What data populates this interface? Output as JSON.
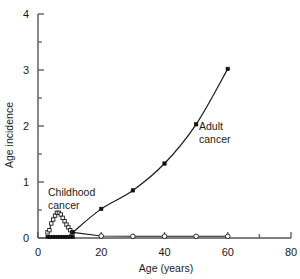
{
  "chart_data": {
    "type": "line",
    "title": "",
    "xlabel": "Age (years)",
    "ylabel": "Age incidence",
    "xlim": [
      0,
      80
    ],
    "ylim": [
      0,
      4
    ],
    "grid": false,
    "legend_position": "none",
    "x_major_ticks": [
      0,
      20,
      40,
      60,
      80
    ],
    "x_minor_ticks": [
      10,
      30,
      50,
      70
    ],
    "y_major_ticks": [
      0,
      1,
      2,
      3,
      4
    ],
    "y_minor_ticks": [
      0.5,
      1.5,
      2.5,
      3.5
    ],
    "x_tick_labels": [
      "0",
      "20",
      "40",
      "60",
      "80"
    ],
    "y_tick_labels": [
      "0",
      "1",
      "2",
      "3",
      "4"
    ],
    "series": [
      {
        "name": "Childhood cancer",
        "marker": "open-square",
        "x": [
          3,
          3.6,
          4.2,
          4.8,
          5.4,
          6,
          6.6,
          7.2,
          7.8,
          8.4,
          9,
          9.6,
          10.2,
          10.8
        ],
        "values": [
          0.1,
          0.14,
          0.26,
          0.33,
          0.4,
          0.45,
          0.45,
          0.42,
          0.36,
          0.3,
          0.24,
          0.19,
          0.14,
          0.1
        ]
      },
      {
        "name": "Childhood cancer baseline",
        "marker": "filled-square-dotted",
        "x": [
          3,
          3.8,
          4.6,
          5.4,
          6.2,
          7,
          7.8,
          8.6,
          9.4,
          10.2,
          11
        ],
        "values": [
          0.02,
          0.02,
          0.02,
          0.02,
          0.02,
          0.02,
          0.02,
          0.02,
          0.02,
          0.02,
          0.02
        ]
      },
      {
        "name": "Adult cancer",
        "marker": "filled-square",
        "x": [
          11,
          20,
          30,
          40,
          50,
          60
        ],
        "values": [
          0.1,
          0.52,
          0.85,
          1.33,
          2.03,
          3.02
        ]
      },
      {
        "name": "Low incidence",
        "marker": "open-circle",
        "x": [
          11,
          20,
          30,
          40,
          50,
          60
        ],
        "values": [
          0.1,
          0.035,
          0.03,
          0.03,
          0.03,
          0.03
        ]
      }
    ],
    "annotations": [
      {
        "name": "childhood-cancer-label",
        "line1": "Childhood",
        "line2": "cancer",
        "x": 13,
        "y": 1.0
      },
      {
        "name": "adult-cancer-label",
        "line1": "Adult",
        "line2": "cancer",
        "x": 53,
        "y": 2.18
      }
    ],
    "colors": {
      "axis": "#4d4d4d",
      "line": "#1a1a1a",
      "marker_fill": "#ffffff",
      "marker_stroke": "#1a1a1a",
      "text": "#1a1a1a",
      "background": "#ffffff"
    }
  }
}
